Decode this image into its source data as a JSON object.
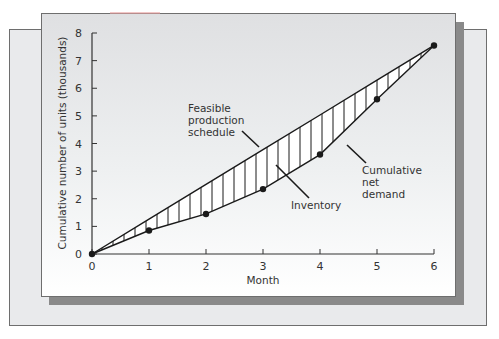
{
  "chart_data": {
    "type": "line",
    "title": "",
    "xlabel": "Month",
    "ylabel": "Cumulative number of units (thousands)",
    "x": [
      0,
      1,
      2,
      3,
      4,
      5,
      6
    ],
    "x_ticks": [
      "0",
      "1",
      "2",
      "3",
      "4",
      "5",
      "6"
    ],
    "y_ticks": [
      "0",
      "1",
      "2",
      "3",
      "4",
      "5",
      "6",
      "7",
      "8"
    ],
    "xlim": [
      0,
      6
    ],
    "ylim": [
      0,
      8
    ],
    "grid": false,
    "series": [
      {
        "name": "Cumulative net demand",
        "values": [
          0,
          0.85,
          1.45,
          2.35,
          3.6,
          5.6,
          7.55
        ],
        "markers": true
      },
      {
        "name": "Feasible production schedule",
        "values": [
          0,
          1.26,
          2.52,
          3.78,
          5.03,
          6.29,
          7.55
        ],
        "markers": false
      }
    ],
    "shaded_region": {
      "name": "Inventory",
      "between": [
        "Feasible production schedule",
        "Cumulative net demand"
      ],
      "pattern": "vertical hatching"
    },
    "annotations": [
      {
        "text": [
          "Feasible",
          "production",
          "schedule"
        ],
        "points_to": "Feasible production schedule"
      },
      {
        "text": [
          "Inventory"
        ],
        "points_to": "Inventory"
      },
      {
        "text": [
          "Cumulative",
          "net",
          "demand"
        ],
        "points_to": "Cumulative net demand"
      }
    ]
  },
  "labels": {
    "xlabel": "Month",
    "ylabel": "Cumulative number of units (thousands)",
    "feasible": [
      "Feasible",
      "production",
      "schedule"
    ],
    "inventory": "Inventory",
    "demand": [
      "Cumulative",
      "net",
      "demand"
    ]
  },
  "colors": {
    "line": "#1a1a1a",
    "hatch_fill": "#ffffff",
    "panel": "#e6e7e9",
    "frame": "#e9eaec",
    "shadow": "#8a8a8a"
  }
}
